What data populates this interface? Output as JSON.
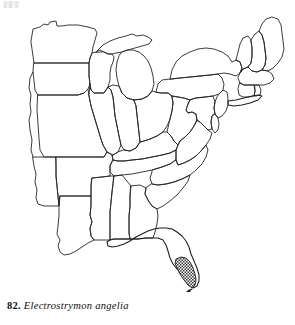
{
  "figure": {
    "caption_number": "82.",
    "caption_species": "Electrostrymon angelia",
    "plate_type": "species-distribution-map",
    "region_depicted": "Eastern United States",
    "background_color": "#ffffff",
    "outline_color": "#262626",
    "shading_color": "#1c1c1c"
  },
  "map": {
    "name": "eastern-united-states-outline-map",
    "projection_note": "state outlines, western states cropped at left edge",
    "distribution": {
      "label": "shaded range",
      "pattern": "cross-hatch",
      "areas": [
        "southern tip of Florida",
        "Florida Keys"
      ]
    },
    "states": [
      {
        "code": "MN",
        "name": "Minnesota"
      },
      {
        "code": "WI",
        "name": "Wisconsin"
      },
      {
        "code": "MI",
        "name": "Michigan"
      },
      {
        "code": "IA",
        "name": "Iowa"
      },
      {
        "code": "IL",
        "name": "Illinois"
      },
      {
        "code": "IN",
        "name": "Indiana"
      },
      {
        "code": "OH",
        "name": "Ohio"
      },
      {
        "code": "MO",
        "name": "Missouri"
      },
      {
        "code": "KY",
        "name": "Kentucky"
      },
      {
        "code": "WV",
        "name": "West Virginia"
      },
      {
        "code": "PA",
        "name": "Pennsylvania"
      },
      {
        "code": "NY",
        "name": "New York"
      },
      {
        "code": "VT",
        "name": "Vermont"
      },
      {
        "code": "NH",
        "name": "New Hampshire"
      },
      {
        "code": "ME",
        "name": "Maine"
      },
      {
        "code": "MA",
        "name": "Massachusetts"
      },
      {
        "code": "CT",
        "name": "Connecticut"
      },
      {
        "code": "RI",
        "name": "Rhode Island"
      },
      {
        "code": "NJ",
        "name": "New Jersey"
      },
      {
        "code": "DE",
        "name": "Delaware"
      },
      {
        "code": "MD",
        "name": "Maryland"
      },
      {
        "code": "VA",
        "name": "Virginia"
      },
      {
        "code": "NC",
        "name": "North Carolina"
      },
      {
        "code": "SC",
        "name": "South Carolina"
      },
      {
        "code": "GA",
        "name": "Georgia"
      },
      {
        "code": "FL",
        "name": "Florida"
      },
      {
        "code": "AL",
        "name": "Alabama"
      },
      {
        "code": "MS",
        "name": "Mississippi"
      },
      {
        "code": "TN",
        "name": "Tennessee"
      },
      {
        "code": "AR",
        "name": "Arkansas"
      },
      {
        "code": "LA",
        "name": "Louisiana"
      },
      {
        "code": "OK",
        "name": "Oklahoma"
      },
      {
        "code": "KS",
        "name": "Kansas"
      },
      {
        "code": "NE",
        "name": "Nebraska"
      },
      {
        "code": "SD",
        "name": "South Dakota"
      },
      {
        "code": "ND",
        "name": "North Dakota"
      }
    ]
  }
}
